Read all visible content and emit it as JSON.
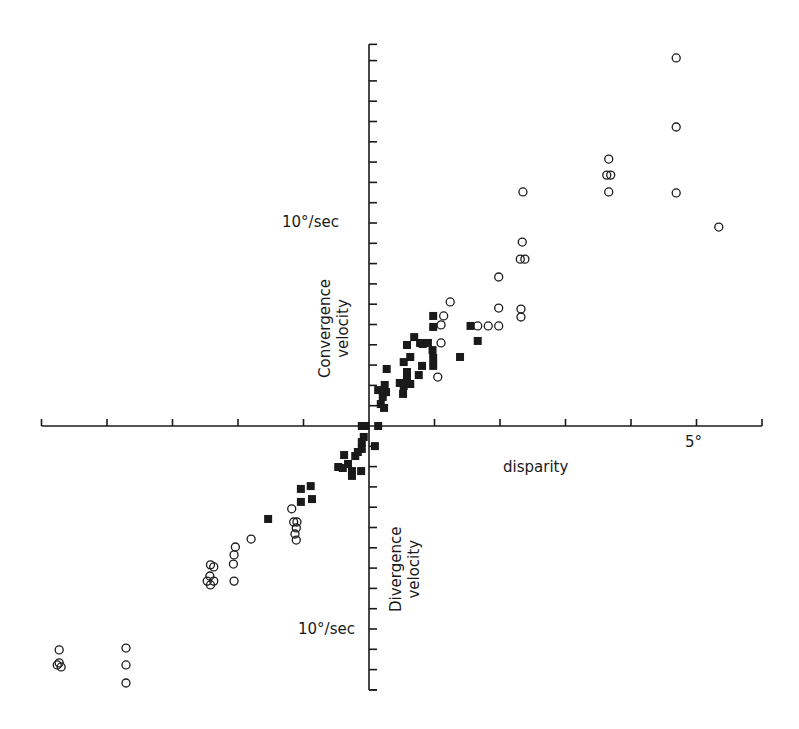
{
  "chart_data": {
    "type": "scatter",
    "title": "",
    "xlabel": "disparity",
    "ylabel_positive": "Convergence velocity",
    "ylabel_negative": "Divergence velocity",
    "x_tick_label": "5°",
    "y_tick_label_positive": "10°/sec",
    "y_tick_label_negative": "10°/sec",
    "xlim": [
      -5,
      6
    ],
    "ylim": [
      -13,
      18.8
    ],
    "x_tick_step": 1,
    "y_tick_step": 1,
    "grid": false,
    "axes_style": "cross-at-origin",
    "series": [
      {
        "name": "filled squares",
        "marker": "filled-square",
        "points": [
          [
            0.98,
            5.42
          ],
          [
            0.98,
            4.88
          ],
          [
            1.55,
            4.93
          ],
          [
            1.66,
            4.19
          ],
          [
            1.39,
            3.4
          ],
          [
            0.69,
            4.38
          ],
          [
            0.78,
            4.09
          ],
          [
            0.58,
            3.99
          ],
          [
            0.63,
            3.4
          ],
          [
            0.53,
            3.15
          ],
          [
            0.82,
            4.04
          ],
          [
            0.9,
            4.09
          ],
          [
            0.97,
            3.74
          ],
          [
            0.98,
            3.35
          ],
          [
            0.98,
            2.96
          ],
          [
            0.81,
            2.96
          ],
          [
            0.76,
            2.51
          ],
          [
            0.27,
            2.81
          ],
          [
            0.58,
            2.66
          ],
          [
            0.58,
            2.36
          ],
          [
            0.63,
            2.07
          ],
          [
            0.47,
            2.12
          ],
          [
            0.53,
            1.97
          ],
          [
            0.52,
            1.58
          ],
          [
            0.14,
            1.77
          ],
          [
            0.24,
            2.02
          ],
          [
            0.26,
            1.67
          ],
          [
            0.21,
            1.43
          ],
          [
            0.18,
            1.08
          ],
          [
            0.23,
            0.89
          ],
          [
            -0.11,
            0.0
          ],
          [
            -0.05,
            0.0
          ],
          [
            0.14,
            0.0
          ],
          [
            -0.08,
            -0.54
          ],
          [
            -0.11,
            -0.79
          ],
          [
            -0.11,
            -1.13
          ],
          [
            0.09,
            -0.99
          ],
          [
            -0.38,
            -1.43
          ],
          [
            -0.21,
            -1.48
          ],
          [
            -0.17,
            -1.28
          ],
          [
            -0.47,
            -2.02
          ],
          [
            -0.4,
            -2.07
          ],
          [
            -0.32,
            -1.87
          ],
          [
            -0.26,
            -2.22
          ],
          [
            -0.26,
            -2.46
          ],
          [
            -0.12,
            -2.22
          ],
          [
            -1.04,
            -3.1
          ],
          [
            -0.89,
            -2.96
          ],
          [
            -1.04,
            -3.74
          ],
          [
            -0.87,
            -3.6
          ],
          [
            -1.54,
            -4.58
          ]
        ]
      },
      {
        "name": "open circles",
        "marker": "open-circle",
        "points": [
          [
            4.69,
            18.13
          ],
          [
            4.69,
            14.73
          ],
          [
            3.66,
            13.15
          ],
          [
            3.63,
            12.36
          ],
          [
            3.69,
            12.36
          ],
          [
            3.66,
            11.53
          ],
          [
            4.69,
            11.48
          ],
          [
            5.34,
            9.8
          ],
          [
            2.35,
            11.53
          ],
          [
            2.34,
            9.06
          ],
          [
            2.31,
            8.22
          ],
          [
            2.38,
            8.22
          ],
          [
            1.98,
            7.34
          ],
          [
            1.24,
            6.11
          ],
          [
            1.98,
            5.81
          ],
          [
            2.32,
            5.76
          ],
          [
            2.32,
            5.37
          ],
          [
            1.14,
            5.42
          ],
          [
            1.66,
            4.93
          ],
          [
            1.82,
            4.93
          ],
          [
            1.98,
            4.93
          ],
          [
            1.1,
            4.98
          ],
          [
            1.1,
            4.09
          ],
          [
            1.05,
            2.41
          ],
          [
            -1.18,
            -4.08
          ],
          [
            -1.15,
            -4.73
          ],
          [
            -1.1,
            -4.73
          ],
          [
            -1.11,
            -5.02
          ],
          [
            -1.13,
            -5.32
          ],
          [
            -1.11,
            -5.62
          ],
          [
            -1.8,
            -5.57
          ],
          [
            -2.04,
            -5.96
          ],
          [
            -2.06,
            -6.35
          ],
          [
            -2.07,
            -6.8
          ],
          [
            -2.06,
            -7.64
          ],
          [
            -2.42,
            -6.84
          ],
          [
            -2.37,
            -6.94
          ],
          [
            -2.43,
            -7.39
          ],
          [
            -2.47,
            -7.64
          ],
          [
            -2.37,
            -7.64
          ],
          [
            -2.42,
            -7.83
          ],
          [
            -4.73,
            -11.03
          ],
          [
            -4.76,
            -11.77
          ],
          [
            -4.7,
            -11.87
          ],
          [
            -4.73,
            -11.67
          ],
          [
            -3.71,
            -10.94
          ],
          [
            -3.71,
            -11.77
          ],
          [
            -3.71,
            -12.66
          ]
        ]
      }
    ]
  },
  "labels": {
    "x_axis": "disparity",
    "x_tick_5": "5°",
    "y_pos_tick": "10°/sec",
    "y_neg_tick": "10°/sec",
    "convergence_line1": "Convergence",
    "convergence_line2": "velocity",
    "divergence_line1": "Divergence",
    "divergence_line2": "velocity"
  },
  "colors": {
    "ink": "#1a1a1a",
    "background": "#ffffff"
  }
}
